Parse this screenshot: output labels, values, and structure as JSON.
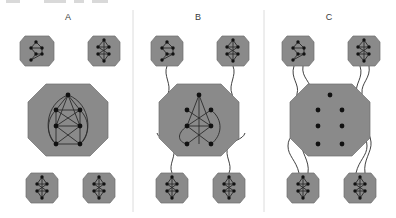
{
  "figure": {
    "title": "",
    "background_color": "#ffffff",
    "width": 396,
    "height": 218,
    "node_color": "#111111",
    "edge_color": "#2b2b2b",
    "module_fill": "#8a8a8a",
    "module_stroke": "#6f6f6f",
    "divider_color": "#d8d8d8",
    "label_color": "#3a3a3a"
  },
  "panels": [
    {
      "id": "A",
      "label": "A",
      "label_x": 68,
      "label_y": 20,
      "description": "fully modular: four peripheral modules fully disconnected from a dense central module",
      "inter_module_links": 0,
      "center": {
        "name": "central-module-a",
        "cx": 68,
        "cy": 120,
        "rx": 40,
        "ry": 36,
        "internal_edges": 18,
        "nodes": 7
      },
      "satellites": [
        {
          "name": "module-a-top-left",
          "cx": 37,
          "cy": 51,
          "rx": 17,
          "ry": 21,
          "nodes": 6,
          "internal_edges": 6
        },
        {
          "name": "module-a-top-right",
          "cx": 104,
          "cy": 51,
          "rx": 16,
          "ry": 21,
          "nodes": 6,
          "internal_edges": 7
        },
        {
          "name": "module-a-bottom-left",
          "cx": 42,
          "cy": 188,
          "rx": 16,
          "ry": 21,
          "nodes": 6,
          "internal_edges": 7
        },
        {
          "name": "module-a-bottom-right",
          "cx": 99,
          "cy": 188,
          "rx": 16,
          "ry": 21,
          "nodes": 6,
          "internal_edges": 7
        }
      ]
    },
    {
      "id": "B",
      "label": "B",
      "label_x": 198,
      "label_y": 20,
      "description": "partially connected: each peripheral module joined to the centre by a single long link",
      "inter_module_links": 4,
      "center": {
        "name": "central-module-b",
        "cx": 199,
        "cy": 120,
        "rx": 40,
        "ry": 36,
        "internal_edges": 10,
        "nodes": 7
      },
      "satellites": [
        {
          "name": "module-b-top-left",
          "cx": 167,
          "cy": 51,
          "rx": 17,
          "ry": 21,
          "nodes": 6,
          "internal_edges": 6
        },
        {
          "name": "module-b-top-right",
          "cx": 233,
          "cy": 51,
          "rx": 16,
          "ry": 21,
          "nodes": 6,
          "internal_edges": 7
        },
        {
          "name": "module-b-bottom-left",
          "cx": 172,
          "cy": 188,
          "rx": 16,
          "ry": 21,
          "nodes": 6,
          "internal_edges": 7
        },
        {
          "name": "module-b-bottom-right",
          "cx": 229,
          "cy": 188,
          "rx": 16,
          "ry": 21,
          "nodes": 6,
          "internal_edges": 7
        }
      ]
    },
    {
      "id": "C",
      "label": "C",
      "label_x": 329,
      "label_y": 20,
      "description": "dissolved centre: central nodes carry no internal edges, all links run to the periphery",
      "inter_module_links": 8,
      "center": {
        "name": "central-module-c",
        "cx": 330,
        "cy": 120,
        "rx": 40,
        "ry": 36,
        "internal_edges": 0,
        "nodes": 7
      },
      "satellites": [
        {
          "name": "module-c-top-left",
          "cx": 298,
          "cy": 51,
          "rx": 17,
          "ry": 21,
          "nodes": 6,
          "internal_edges": 6
        },
        {
          "name": "module-c-top-right",
          "cx": 364,
          "cy": 51,
          "rx": 16,
          "ry": 21,
          "nodes": 6,
          "internal_edges": 7
        },
        {
          "name": "module-c-bottom-left",
          "cx": 303,
          "cy": 188,
          "rx": 16,
          "ry": 21,
          "nodes": 6,
          "internal_edges": 7
        },
        {
          "name": "module-c-bottom-right",
          "cx": 360,
          "cy": 188,
          "rx": 16,
          "ry": 21,
          "nodes": 6,
          "internal_edges": 7
        }
      ]
    }
  ],
  "dividers": [
    {
      "name": "divider-a-b",
      "x": 133,
      "y1": 10,
      "y2": 212
    },
    {
      "name": "divider-b-c",
      "x": 264,
      "y1": 10,
      "y2": 212
    }
  ],
  "top_artifacts": [
    {
      "name": "cropped-caption-fragment-1",
      "x": 6,
      "y": 0,
      "w": 14,
      "h": 3
    },
    {
      "name": "cropped-caption-fragment-2",
      "x": 44,
      "y": 0,
      "w": 22,
      "h": 3
    },
    {
      "name": "cropped-caption-fragment-3",
      "x": 74,
      "y": 0,
      "w": 10,
      "h": 3
    },
    {
      "name": "cropped-caption-fragment-4",
      "x": 92,
      "y": 0,
      "w": 16,
      "h": 3
    }
  ]
}
